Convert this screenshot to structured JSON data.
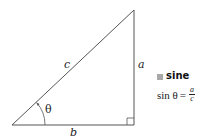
{
  "diagram": {
    "type": "right-triangle",
    "vertices": {
      "top": [
        134,
        10
      ],
      "bottom_left": [
        12,
        125
      ],
      "bottom_right": [
        134,
        125
      ]
    },
    "colors": {
      "stroke": "#555555",
      "legend_box": "#a8a8a8",
      "text": "#222222"
    },
    "labels": {
      "hypotenuse": "c",
      "opposite": "a",
      "adjacent": "b",
      "angle": "θ"
    }
  },
  "legend": {
    "title": "sine",
    "formula": {
      "lhs": "sin θ",
      "equals": "=",
      "numerator": "a",
      "denominator": "c"
    }
  }
}
